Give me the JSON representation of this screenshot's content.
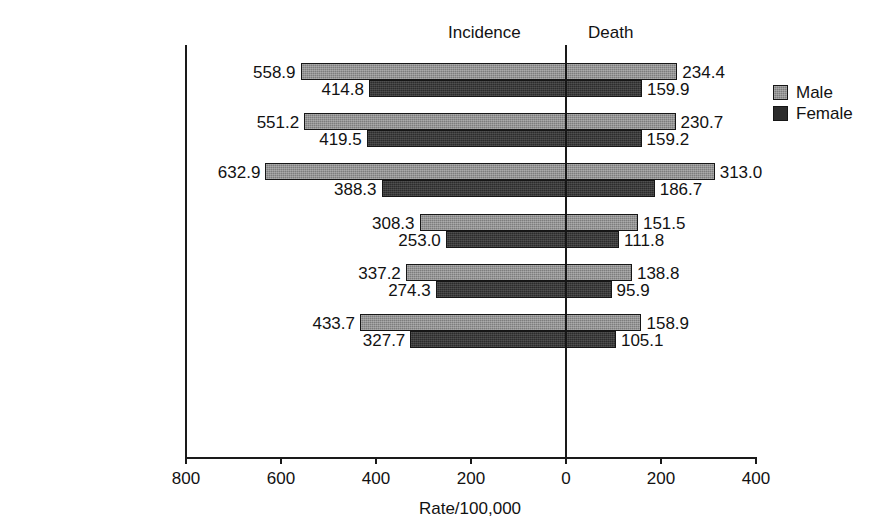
{
  "chart_data": {
    "type": "bar",
    "orientation": "horizontal",
    "style": "back-to-back population pyramid",
    "title": "",
    "xlabel": "Rate/100,000",
    "ylabel": "",
    "panels": [
      {
        "name": "incidence",
        "label": "Incidence",
        "direction": "left"
      },
      {
        "name": "death",
        "label": "Death",
        "direction": "right"
      }
    ],
    "categories": [
      "All races",
      "White",
      "Black",
      "American Indian/\nAlaska Native",
      "Asian/Pacific\nIslander",
      "Hispanic†"
    ],
    "legend": {
      "position": "right",
      "entries": [
        {
          "name": "male",
          "label": "Male",
          "color": "#7d7d7d"
        },
        {
          "name": "female",
          "label": "Female",
          "color": "#2c2c2c"
        }
      ]
    },
    "axis": {
      "tick_labels": [
        "800",
        "600",
        "400",
        "200",
        "0",
        "200",
        "400"
      ],
      "tick_values": [
        -800,
        -600,
        -400,
        -200,
        0,
        200,
        400
      ],
      "xlim": [
        -800,
        400
      ],
      "grid": false
    },
    "series": [
      {
        "name": "Male",
        "incidence": [
          558.9,
          551.2,
          632.9,
          308.3,
          337.2,
          433.7
        ],
        "death": [
          234.4,
          230.7,
          313.0,
          151.5,
          138.8,
          158.9
        ]
      },
      {
        "name": "Female",
        "incidence": [
          414.8,
          419.5,
          388.3,
          253.0,
          274.3,
          327.7
        ],
        "death": [
          159.9,
          159.2,
          186.7,
          111.8,
          95.9,
          105.1
        ]
      }
    ],
    "data_labels": {
      "incidence_male": [
        "558.9",
        "551.2",
        "632.9",
        "308.3",
        "337.2",
        "433.7"
      ],
      "incidence_female": [
        "414.8",
        "419.5",
        "388.3",
        "253.0",
        "274.3",
        "327.7"
      ],
      "death_male": [
        "234.4",
        "230.7",
        "313.0",
        "151.5",
        "138.8",
        "158.9"
      ],
      "death_female": [
        "159.9",
        "159.2",
        "186.7",
        "111.8",
        "95.9",
        "105.1"
      ]
    }
  }
}
